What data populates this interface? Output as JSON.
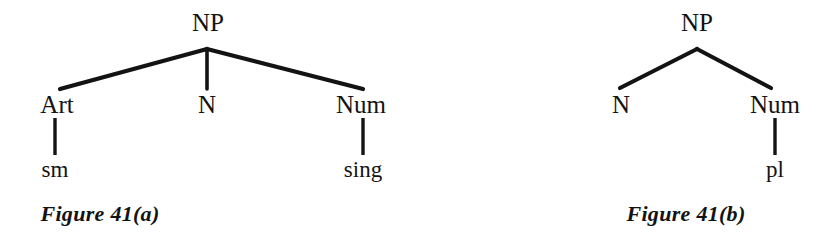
{
  "page": {
    "background_color": "#ffffff",
    "ink_color": "#131313",
    "width": 832,
    "height": 239
  },
  "figures": [
    {
      "id": "figure-41a",
      "caption": "Figure  41(a)",
      "caption_x": 100,
      "caption_y": 203,
      "root": {
        "label": "NP",
        "x": 208,
        "y": 10
      },
      "children": [
        {
          "label": "Art",
          "x": 57,
          "y": 92,
          "terminal": {
            "label": "sm",
            "x": 55,
            "y": 158
          }
        },
        {
          "label": "N",
          "x": 207,
          "y": 92,
          "terminal": null
        },
        {
          "label": "Num",
          "x": 361,
          "y": 92,
          "terminal": {
            "label": "sing",
            "x": 363,
            "y": 158
          }
        }
      ],
      "edges": [
        {
          "name": "branch-np-art",
          "x1": 207,
          "y1": 49,
          "x2": 60,
          "y2": 89
        },
        {
          "name": "branch-np-n",
          "x1": 207,
          "y1": 49,
          "x2": 207,
          "y2": 89
        },
        {
          "name": "branch-np-num",
          "x1": 207,
          "y1": 49,
          "x2": 363,
          "y2": 89
        },
        {
          "name": "stem-art-sm",
          "x1": 55,
          "y1": 118,
          "x2": 55,
          "y2": 155
        },
        {
          "name": "stem-num-sing",
          "x1": 363,
          "y1": 118,
          "x2": 363,
          "y2": 155
        }
      ]
    },
    {
      "id": "figure-41b",
      "caption": "Figure  41(b)",
      "caption_x": 686,
      "caption_y": 203,
      "root": {
        "label": "NP",
        "x": 697,
        "y": 10
      },
      "children": [
        {
          "label": "N",
          "x": 621,
          "y": 92,
          "terminal": null
        },
        {
          "label": "Num",
          "x": 775,
          "y": 92,
          "terminal": {
            "label": "pl",
            "x": 775,
            "y": 158
          }
        }
      ],
      "edges": [
        {
          "name": "branch-np-n",
          "x1": 697,
          "y1": 49,
          "x2": 620,
          "y2": 88
        },
        {
          "name": "branch-np-num",
          "x1": 697,
          "y1": 49,
          "x2": 771,
          "y2": 88
        },
        {
          "name": "stem-num-pl",
          "x1": 775,
          "y1": 118,
          "x2": 775,
          "y2": 155
        }
      ]
    }
  ]
}
